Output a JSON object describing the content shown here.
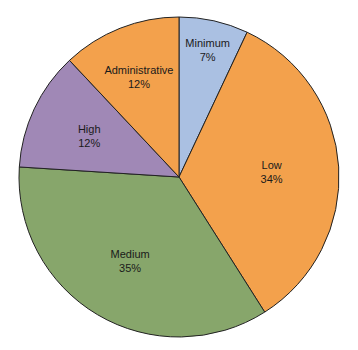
{
  "chart_data": {
    "type": "pie",
    "title": "",
    "start_angle_deg": 0,
    "direction": "clockwise",
    "slices": [
      {
        "label": "Minimum",
        "value": 7,
        "display": "7%",
        "color": "#aac0e2"
      },
      {
        "label": "Low",
        "value": 34,
        "display": "34%",
        "color": "#f3a14c"
      },
      {
        "label": "Medium",
        "value": 35,
        "display": "35%",
        "color": "#87a66b"
      },
      {
        "label": "High",
        "value": 12,
        "display": "12%",
        "color": "#a088b6"
      },
      {
        "label": "Administrative",
        "value": 12,
        "display": "12%",
        "color": "#f3a14c"
      }
    ],
    "legend": "none"
  }
}
